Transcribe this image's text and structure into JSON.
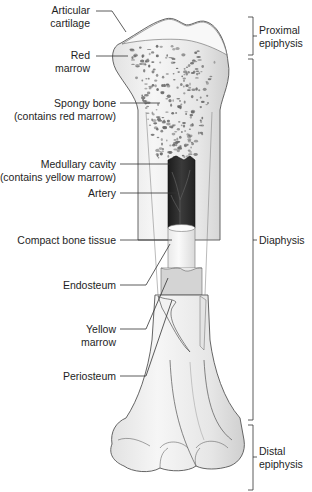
{
  "diagram": {
    "colors": {
      "bone_fill": "#efefef",
      "bone_shade": "#d6d6d6",
      "bone_outline": "#555555",
      "cartilage": "#f7f7f7",
      "spongy_dots": "#6a6a6a",
      "medullary_dark": "#2a2a2a",
      "leader_lines": "#333333",
      "background": "#ffffff"
    },
    "left_labels": [
      {
        "id": "articular-cartilage",
        "lines": [
          "Articular",
          "cartilage"
        ]
      },
      {
        "id": "red-marrow",
        "lines": [
          "Red",
          "marrow"
        ]
      },
      {
        "id": "spongy-bone",
        "lines": [
          "Spongy bone",
          "(contains red marrow)"
        ]
      },
      {
        "id": "medullary-cavity",
        "lines": [
          "Medullary cavity",
          "(contains yellow marrow)"
        ]
      },
      {
        "id": "artery",
        "lines": [
          "Artery"
        ]
      },
      {
        "id": "compact-bone-tissue",
        "lines": [
          "Compact bone tissue"
        ]
      },
      {
        "id": "endosteum",
        "lines": [
          "Endosteum"
        ]
      },
      {
        "id": "yellow-marrow",
        "lines": [
          "Yellow",
          "marrow"
        ]
      },
      {
        "id": "periosteum",
        "lines": [
          "Periosteum"
        ]
      }
    ],
    "right_brackets": [
      {
        "id": "proximal-epiphysis",
        "lines": [
          "Proximal",
          "epiphysis"
        ]
      },
      {
        "id": "diaphysis",
        "lines": [
          "Diaphysis"
        ]
      },
      {
        "id": "distal-epiphysis",
        "lines": [
          "Distal",
          "epiphysis"
        ]
      }
    ]
  }
}
